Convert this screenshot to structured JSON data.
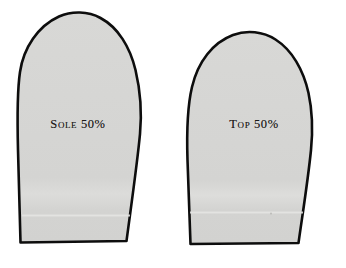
{
  "sheet": {
    "background_color": "#ffffff",
    "description": "Scanned slipper pattern sheet with two pattern pieces"
  },
  "pieces": [
    {
      "id": "sole",
      "label": "Sole 50%",
      "name_text": "Sole",
      "scale_text": "50%",
      "fill_color": "#d6d6d4",
      "outline_color": "#0d0d0d"
    },
    {
      "id": "top",
      "label": "Top 50%",
      "name_text": "Top",
      "scale_text": "50%",
      "fill_color": "#d6d6d4",
      "outline_color": "#0d0d0d"
    }
  ]
}
